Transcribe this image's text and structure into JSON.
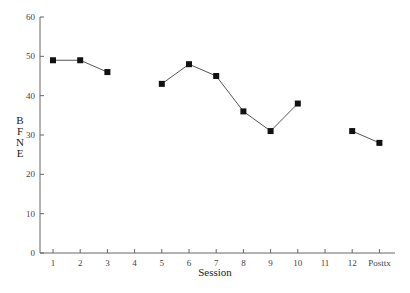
{
  "chart_data": {
    "type": "line",
    "title": "",
    "xlabel": "Session",
    "ylabel": "BFNE",
    "ylim": [
      0,
      60
    ],
    "yticks": [
      0,
      10,
      20,
      30,
      40,
      50,
      60
    ],
    "categories": [
      "1",
      "2",
      "3",
      "4",
      "5",
      "6",
      "7",
      "8",
      "9",
      "10",
      "11",
      "12",
      "Posttx"
    ],
    "series": [
      {
        "name": "BFNE",
        "values": [
          49,
          49,
          46,
          null,
          43,
          48,
          45,
          36,
          31,
          38,
          null,
          31,
          28
        ]
      }
    ],
    "grid": false,
    "legend": null
  },
  "labels": {
    "xlabel": "Session",
    "ylabel_letters": [
      "B",
      "F",
      "N",
      "E"
    ]
  }
}
